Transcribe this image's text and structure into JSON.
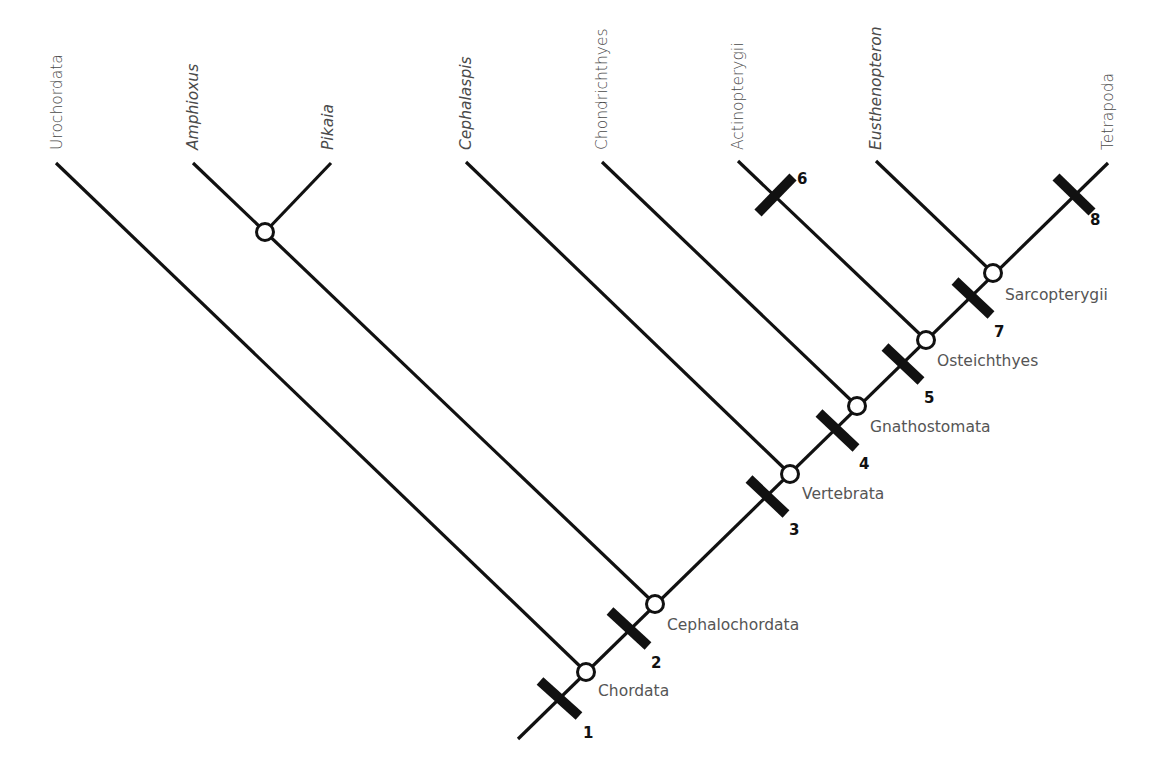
{
  "colors": {
    "line": "#111111",
    "label": "#4a4a4a",
    "node_fill": "#ffffff"
  },
  "stem": {
    "x1": 518,
    "y1": 739,
    "x2": 1108,
    "y2": 163
  },
  "taxa": [
    {
      "name": "Urochordata",
      "italic": false,
      "tip": [
        56,
        163
      ],
      "base": [
        586,
        672
      ],
      "label_x": 62,
      "label_y": 150
    },
    {
      "name": "Amphioxus",
      "italic": true,
      "tip": [
        193,
        163
      ],
      "base": [
        655,
        604
      ],
      "label_x": 198,
      "label_y": 150
    },
    {
      "name": "Pikaia",
      "italic": true,
      "tip": [
        331,
        163
      ],
      "base": [
        265,
        232
      ],
      "label_x": 333,
      "label_y": 150
    },
    {
      "name": "Cephalaspis",
      "italic": true,
      "tip": [
        466,
        162
      ],
      "base": [
        790,
        474
      ],
      "label_x": 471,
      "label_y": 150
    },
    {
      "name": "Chondrichthyes",
      "italic": false,
      "tip": [
        602,
        162
      ],
      "base": [
        857,
        406
      ],
      "label_x": 607,
      "label_y": 150
    },
    {
      "name": "Actinopterygii",
      "italic": false,
      "tip": [
        738,
        161
      ],
      "base": [
        926,
        340
      ],
      "label_x": 743,
      "label_y": 150
    },
    {
      "name": "Eusthenopteron",
      "italic": true,
      "tip": [
        876,
        161
      ],
      "base": [
        993,
        273
      ],
      "label_x": 881,
      "label_y": 150
    },
    {
      "name": "Tetrapoda",
      "italic": false,
      "tip": [
        1108,
        163
      ],
      "base": [
        1108,
        163
      ],
      "label_x": 1113,
      "label_y": 150
    }
  ],
  "nodes": [
    {
      "name": "Chordata",
      "x": 586,
      "y": 672,
      "label_x": 598,
      "label_y": 696
    },
    {
      "name": "Cephalochordata",
      "x": 655,
      "y": 604,
      "label_x": 667,
      "label_y": 630
    },
    {
      "name": "",
      "x": 265,
      "y": 232,
      "label_x": 0,
      "label_y": 0
    },
    {
      "name": "Vertebrata",
      "x": 790,
      "y": 474,
      "label_x": 802,
      "label_y": 499
    },
    {
      "name": "Gnathostomata",
      "x": 857,
      "y": 406,
      "label_x": 870,
      "label_y": 432
    },
    {
      "name": "Osteichthyes",
      "x": 926,
      "y": 340,
      "label_x": 937,
      "label_y": 366
    },
    {
      "name": "Sarcopterygii",
      "x": 993,
      "y": 273,
      "label_x": 1005,
      "label_y": 300
    }
  ],
  "characters": [
    {
      "id": "1",
      "x1": 540,
      "y1": 681,
      "x2": 579,
      "y2": 716,
      "label_x": 583,
      "label_y": 738
    },
    {
      "id": "2",
      "x1": 610,
      "y1": 611,
      "x2": 648,
      "y2": 646,
      "label_x": 651,
      "label_y": 668
    },
    {
      "id": "3",
      "x1": 749,
      "y1": 479,
      "x2": 786,
      "y2": 514,
      "label_x": 789,
      "label_y": 535
    },
    {
      "id": "4",
      "x1": 819,
      "y1": 413,
      "x2": 856,
      "y2": 448,
      "label_x": 859,
      "label_y": 469
    },
    {
      "id": "5",
      "x1": 885,
      "y1": 347,
      "x2": 921,
      "y2": 381,
      "label_x": 924,
      "label_y": 403
    },
    {
      "id": "6",
      "x1": 758,
      "y1": 213,
      "x2": 793,
      "y2": 177,
      "label_x": 797,
      "label_y": 184
    },
    {
      "id": "7",
      "x1": 955,
      "y1": 281,
      "x2": 991,
      "y2": 315,
      "label_x": 994,
      "label_y": 337
    },
    {
      "id": "8",
      "x1": 1056,
      "y1": 177,
      "x2": 1092,
      "y2": 212,
      "label_x": 1090,
      "label_y": 225
    }
  ]
}
